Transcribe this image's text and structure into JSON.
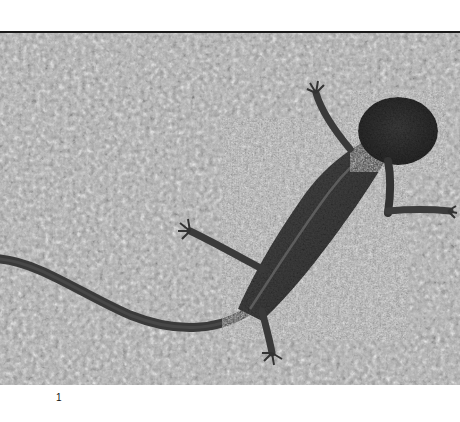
{
  "figure": {
    "image": {
      "subject": "salamander on gravel",
      "style": "grayscale photograph",
      "colors": {
        "gravel": "#a9a9a9",
        "body": "#3a3a3a",
        "head": "#2e2e2e",
        "top_border": "#1a1a1a"
      }
    },
    "label": "1"
  }
}
